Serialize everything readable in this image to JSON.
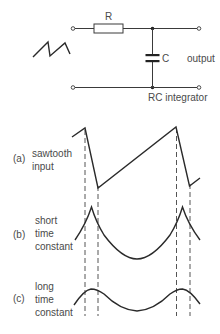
{
  "circuit": {
    "resistor_label": "R",
    "capacitor_label": "C",
    "output_label": "output",
    "caption": "RC integrator",
    "input_symbol": "sawtooth-wave-icon"
  },
  "waveforms": [
    {
      "tag": "(a)",
      "lines": [
        "sawtooth",
        "input"
      ]
    },
    {
      "tag": "(b)",
      "lines": [
        "short",
        "time",
        "constant"
      ]
    },
    {
      "tag": "(c)",
      "lines": [
        "long",
        "time",
        "constant"
      ]
    }
  ],
  "colors": {
    "line": "#2a2a2a",
    "text": "#4a4a4a",
    "background": "#ffffff"
  }
}
